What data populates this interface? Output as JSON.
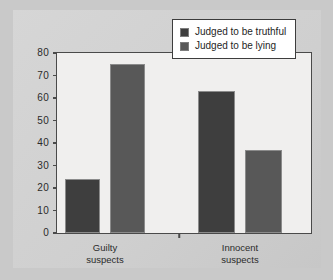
{
  "chart_data": {
    "type": "bar",
    "title": "",
    "xlabel": "",
    "ylabel": "",
    "ylim": [
      0,
      80
    ],
    "yticks": [
      "0",
      "10",
      "20",
      "30",
      "40",
      "50",
      "60",
      "70",
      "80"
    ],
    "ytick_values": [
      0,
      10,
      20,
      30,
      40,
      50,
      60,
      70,
      80
    ],
    "grid": false,
    "legend_position": "top-right",
    "categories": [
      "Guilty suspects",
      "Innocent suspects"
    ],
    "category_lines": [
      {
        "line1": "Guilty",
        "line2": "suspects"
      },
      {
        "line1": "Innocent",
        "line2": "suspects"
      }
    ],
    "series": [
      {
        "name": "Judged to be truthful",
        "color": "#3e3e3e",
        "values": [
          24,
          63
        ]
      },
      {
        "name": "Judged to be lying",
        "color": "#585858",
        "values": [
          75,
          37
        ]
      }
    ]
  },
  "legend": {
    "items": [
      {
        "label": "Judged to be truthful",
        "swatch": "truthful-swatch-icon"
      },
      {
        "label": "Judged to be lying",
        "swatch": "lying-swatch-icon"
      }
    ]
  },
  "colors": {
    "figure_background": "#c9c9c9",
    "panel_background": "#d3d3d3",
    "plot_background": "#f0efee",
    "axis": "#4a4a4a",
    "bar_truthful": "#3e3e3e",
    "bar_lying": "#585858",
    "legend_background": "#ffffff",
    "legend_border": "#3d3d3d",
    "text": "#2b2b2b"
  }
}
